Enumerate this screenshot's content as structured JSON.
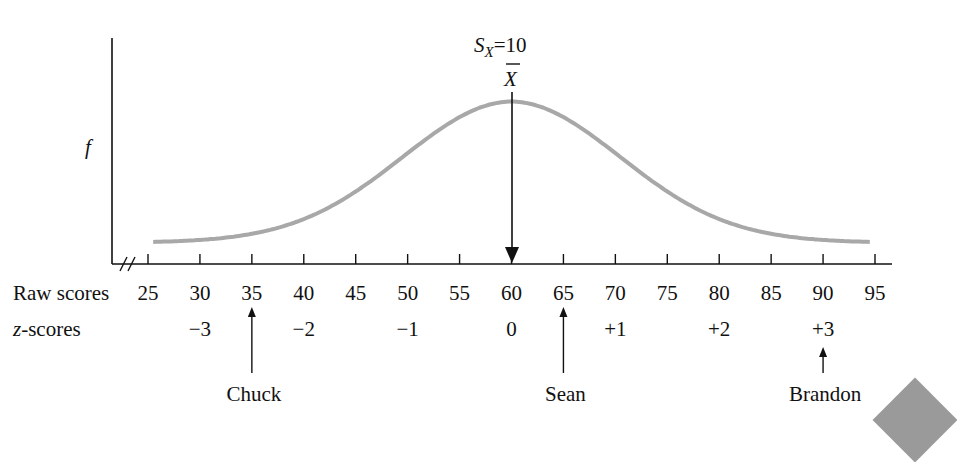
{
  "chart_data": {
    "type": "line",
    "annotation_sd": "S_X=10",
    "annotation_sd_parts": {
      "s": "S",
      "sub": "X",
      "rest": "=10"
    },
    "mean_label": "X̄",
    "ylabel": "f",
    "xlabel_rows": [
      "Raw scores",
      "z-scores"
    ],
    "mean": 60,
    "sd": 10,
    "x_ticks": [
      25,
      30,
      35,
      40,
      45,
      50,
      55,
      60,
      65,
      70,
      75,
      80,
      85,
      90,
      95
    ],
    "x_tick_labels": [
      "25",
      "30",
      "35",
      "40",
      "45",
      "50",
      "55",
      "60",
      "65",
      "70",
      "75",
      "80",
      "85",
      "90",
      "95"
    ],
    "z_scores": [
      {
        "raw": 30,
        "label": "−3"
      },
      {
        "raw": 40,
        "label": "−2"
      },
      {
        "raw": 50,
        "label": "−1"
      },
      {
        "raw": 60,
        "label": "0"
      },
      {
        "raw": 70,
        "label": "+1"
      },
      {
        "raw": 80,
        "label": "+2"
      },
      {
        "raw": 90,
        "label": "+3"
      }
    ],
    "people": [
      {
        "name": "Chuck",
        "raw": 35
      },
      {
        "name": "Sean",
        "raw": 65
      },
      {
        "name": "Brandon",
        "raw": 90
      }
    ],
    "axis_break": true,
    "grid": false,
    "legend": "none",
    "curve_color": "#a8a8a8",
    "xlim": [
      25,
      95
    ]
  }
}
